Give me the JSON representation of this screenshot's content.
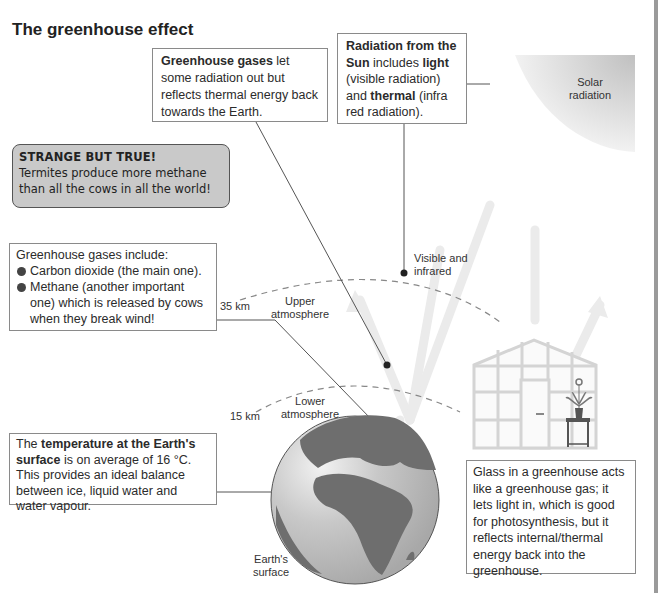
{
  "title": "The greenhouse effect",
  "boxes": {
    "greenhouse_gases": {
      "bold": "Greenhouse gases",
      "text": " let some radiation out but reflects thermal energy back towards the Earth."
    },
    "radiation_sun": {
      "bold1": "Radiation from the Sun",
      "t1": " includes ",
      "bold2": "light",
      "t2": " (visible radiation) and ",
      "bold3": "thermal",
      "t3": " (infra red radiation)."
    },
    "strange": {
      "heading": "STRANGE BUT TRUE!",
      "text": "Termites produce more methane than all the cows in all the world!"
    },
    "gases_include": {
      "heading": "Greenhouse gases include:",
      "items": [
        "Carbon dioxide (the main one).",
        "Methane (another important one) which is released by cows when they break wind!"
      ]
    },
    "temperature": {
      "t1": "The ",
      "bold": "temperature at the Earth's surface",
      "t2": " is on average of 16 °C. This provides an ideal balance between ice, liquid water and water vapour."
    },
    "glass": {
      "text": "Glass in a greenhouse acts like a greenhouse gas; it lets light in, which is good for photosynthesis, but it reflects internal/thermal energy back into the greenhouse."
    }
  },
  "labels": {
    "solar_radiation": "Solar radiation",
    "visible_infrared": "Visible and infrared",
    "km35": "35 km",
    "upper_atmosphere": "Upper atmosphere",
    "km15": "15 km",
    "lower_atmosphere": "Lower atmosphere",
    "earth_surface": "Earth's surface"
  },
  "colors": {
    "sun_gradient_dark": "#c8c8c8",
    "sun_gradient_light": "#f4f4f4",
    "strange_bg": "#c9c9c9",
    "earth_land": "#6e6e6e",
    "earth_ocean": "#c4c4c4",
    "arrow_light": "#ececec",
    "border_gray": "#8a8a8a"
  }
}
